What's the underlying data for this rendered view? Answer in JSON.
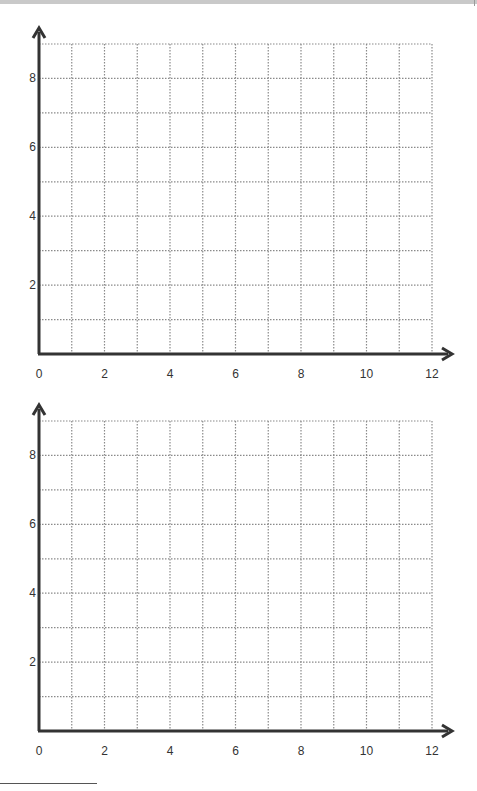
{
  "page": {
    "type": "blank coordinate grid worksheet"
  },
  "colors": {
    "axis": "#333333",
    "grid": "#8a8a8a",
    "text": "#333333",
    "background": "#ffffff"
  },
  "chart_data": [
    {
      "type": "scatter",
      "title": "",
      "xlabel": "",
      "ylabel": "",
      "x": [],
      "y": [],
      "xlim": [
        0,
        12
      ],
      "ylim": [
        0,
        9
      ],
      "xticks": [
        "0",
        "2",
        "4",
        "6",
        "8",
        "10",
        "12"
      ],
      "yticks": [
        "2",
        "4",
        "6",
        "8"
      ],
      "grid": true,
      "grid_style": "dotted",
      "grid_step": 1,
      "legend": null
    },
    {
      "type": "scatter",
      "title": "",
      "xlabel": "",
      "ylabel": "",
      "x": [],
      "y": [],
      "xlim": [
        0,
        12
      ],
      "ylim": [
        0,
        9
      ],
      "xticks": [
        "0",
        "2",
        "4",
        "6",
        "8",
        "10",
        "12"
      ],
      "yticks": [
        "2",
        "4",
        "6",
        "8"
      ],
      "grid": true,
      "grid_style": "dotted",
      "grid_step": 1,
      "legend": null
    }
  ]
}
